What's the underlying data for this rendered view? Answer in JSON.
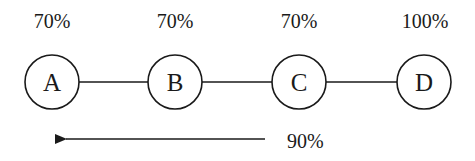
{
  "diagram": {
    "nodes": [
      {
        "id": "A",
        "label": "A",
        "percent": "70%"
      },
      {
        "id": "B",
        "label": "B",
        "percent": "70%"
      },
      {
        "id": "C",
        "label": "C",
        "percent": "70%"
      },
      {
        "id": "D",
        "label": "D",
        "percent": "100%"
      }
    ],
    "edges": [
      {
        "from": "A",
        "to": "B"
      },
      {
        "from": "B",
        "to": "C"
      },
      {
        "from": "C",
        "to": "D"
      }
    ],
    "arrow": {
      "direction": "left",
      "label": "90%"
    },
    "colors": {
      "stroke": "#1a1a1a",
      "background": "#ffffff"
    }
  }
}
